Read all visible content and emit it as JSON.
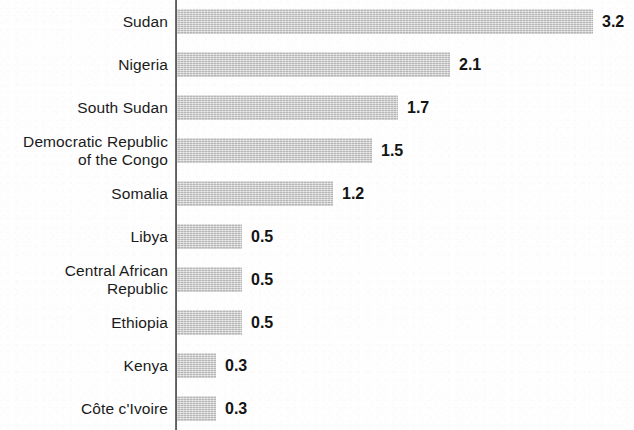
{
  "chart_data": {
    "type": "bar",
    "orientation": "horizontal",
    "title": "",
    "subtitle": "",
    "xlabel": "",
    "ylabel": "",
    "grid": false,
    "legend": false,
    "axis_line": "vertical category axis at left of bars",
    "bar_color": "#c9c9c9",
    "text_color": "#141414",
    "background_color": "#fefefe",
    "xlim": [
      0,
      3.2
    ],
    "value_label_position": "outside-end",
    "categories": [
      "Sudan",
      "Nigeria",
      "South Sudan",
      "Democratic Republic\nof the Congo",
      "Somalia",
      "Libya",
      "Central African\nRepublic",
      "Ethiopia",
      "Kenya",
      "Côte c'Ivoire"
    ],
    "values": [
      3.2,
      2.1,
      1.7,
      1.5,
      1.2,
      0.5,
      0.5,
      0.5,
      0.3,
      0.3
    ],
    "value_labels": [
      "3.2",
      "2.1",
      "1.7",
      "1.5",
      "1.2",
      "0.5",
      "0.5",
      "0.5",
      "0.3",
      "0.3"
    ],
    "bars": [
      {
        "category": "Sudan",
        "value": 3.2,
        "label": "3.2"
      },
      {
        "category": "Nigeria",
        "value": 2.1,
        "label": "2.1"
      },
      {
        "category": "South Sudan",
        "value": 1.7,
        "label": "1.7"
      },
      {
        "category": "Democratic Republic\nof the Congo",
        "value": 1.5,
        "label": "1.5"
      },
      {
        "category": "Somalia",
        "value": 1.2,
        "label": "1.2"
      },
      {
        "category": "Libya",
        "value": 0.5,
        "label": "0.5"
      },
      {
        "category": "Central African\nRepublic",
        "value": 0.5,
        "label": "0.5"
      },
      {
        "category": "Ethiopia",
        "value": 0.5,
        "label": "0.5"
      },
      {
        "category": "Kenya",
        "value": 0.3,
        "label": "0.3"
      },
      {
        "category": "Côte c'Ivoire",
        "value": 0.3,
        "label": "0.3"
      }
    ]
  },
  "layout": {
    "row_pitch_px": 43,
    "first_row_top_px": 0,
    "bar_height_px": 25,
    "bar_origin_x_px": 177,
    "px_per_unit": 130
  }
}
